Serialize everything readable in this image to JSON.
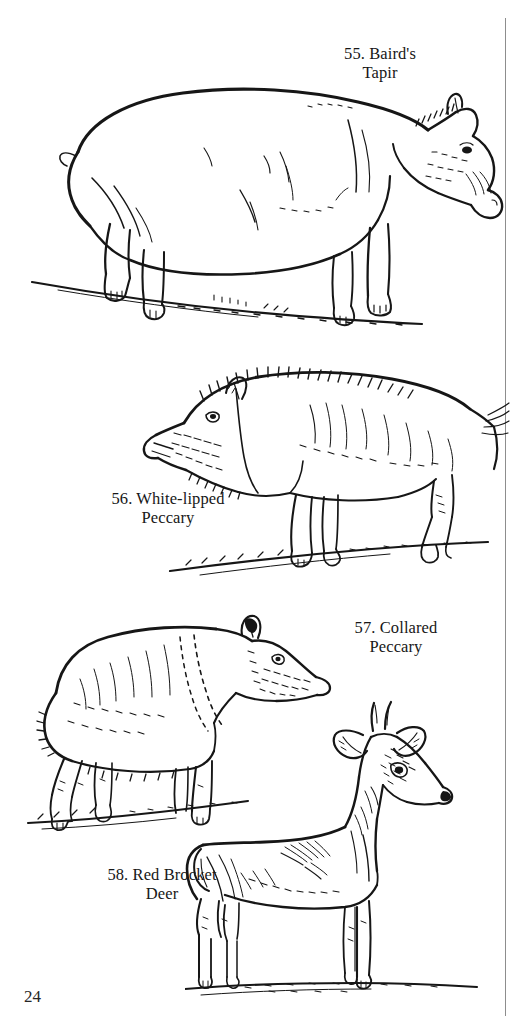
{
  "page": {
    "page_number": "24",
    "background_color": "#ffffff",
    "ink_color": "#1a1a1a",
    "width": 513,
    "height": 1034
  },
  "plates": [
    {
      "number": "55.",
      "name": "Baird's Tapir",
      "caption": "55. Baird's\nTapir",
      "figure": "baird-tapir-line-drawing",
      "notes": "Large tapir in left-facing-right profile standing on sloped ground line, prehensile proboscis, stout legs"
    },
    {
      "number": "56.",
      "name": "White-lipped Peccary",
      "caption": "56. White-lipped\nPeccary",
      "figure": "white-lipped-peccary-line-drawing",
      "notes": "Bristly-backed peccary facing left, coarse hatched coat, slender legs on sloped ground"
    },
    {
      "number": "57.",
      "name": "Collared Peccary",
      "caption": "57. Collared\nPeccary",
      "figure": "collared-peccary-line-drawing",
      "notes": "Smaller peccary facing right, pale collar band across shoulder, head lowered"
    },
    {
      "number": "58.",
      "name": "Red Brocket Deer",
      "caption": "58. Red Brocket\nDeer",
      "figure": "red-brocket-deer-line-drawing",
      "notes": "Slender deer standing alert facing right, short unbranched spike antlers, large ears"
    }
  ],
  "decorations": {
    "gutter_rule": "vertical-rule-right-edge"
  }
}
